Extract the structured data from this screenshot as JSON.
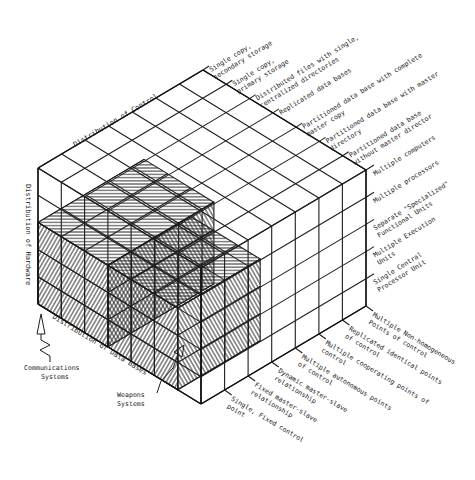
{
  "figure": {
    "grid": {
      "control_cells": 7,
      "data_cells": 7,
      "hardware_tiers": 5
    },
    "colors": {
      "ink": "#1e1e1e",
      "background": "#ffffff"
    }
  },
  "axes": {
    "control": {
      "label": "Distribution of Control"
    },
    "hardware": {
      "label": "Distribution of Hardware"
    },
    "data": {
      "label": "Distribution of Data Bases"
    }
  },
  "data_base_levels": [
    [
      "Single copy,",
      "secondary storage"
    ],
    [
      "Single copy,",
      "primary storage"
    ],
    [
      "Distributed files with single,",
      "centralized directories"
    ],
    [
      "Replicated data bases"
    ],
    [
      "Partitioned data base with complete",
      "master copy"
    ],
    [
      "Partitioned data base with master",
      "directory"
    ],
    [
      "Partitioned data base",
      "without master director"
    ]
  ],
  "hardware_levels": [
    [
      "Multiple computers"
    ],
    [
      "Multiple processors"
    ],
    [
      "Separate \"Specialized\"",
      "Functional Units"
    ],
    [
      "Multiple Execution",
      "Units"
    ],
    [
      "Single Central",
      "Processor Unit"
    ]
  ],
  "control_levels": [
    [
      "Multiple Non-homogeneous",
      "Points of control"
    ],
    [
      "Replicated identical points",
      "of control"
    ],
    [
      "Multiple cooperating points of",
      "control"
    ],
    [
      "Multiple autonomous points",
      "of control"
    ],
    [
      "Dynamic master-slave",
      "relationship"
    ],
    [
      "Fixed master-slave",
      "relationship"
    ],
    [
      "Single, Fixed control",
      "point"
    ]
  ],
  "annotations": {
    "communications": [
      "Communications",
      "Systems"
    ],
    "weapons": [
      "Weapons",
      "Systems"
    ]
  },
  "hatched_regions": [
    {
      "name": "communications-systems-region",
      "control": [
        2.5,
        7
      ],
      "data": [
        0,
        3
      ],
      "hardware": [
        0,
        3
      ]
    },
    {
      "name": "weapons-systems-region",
      "control": [
        3.5,
        7
      ],
      "data": [
        3,
        6
      ],
      "hardware": [
        0,
        3
      ]
    }
  ]
}
